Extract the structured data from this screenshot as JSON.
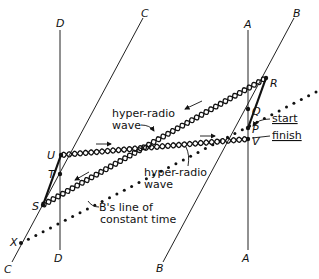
{
  "diagram": {
    "worldlines": [
      {
        "id": "D",
        "top_label": "D",
        "bottom_label": "D"
      },
      {
        "id": "C",
        "top_label": "C",
        "bottom_label": "C"
      },
      {
        "id": "A",
        "top_label": "A",
        "bottom_label": "A"
      },
      {
        "id": "B",
        "top_label": "B",
        "bottom_label": "B"
      }
    ],
    "events": [
      {
        "id": "R",
        "label": "R"
      },
      {
        "id": "Q",
        "label": "Q"
      },
      {
        "id": "P",
        "label": "P"
      },
      {
        "id": "V",
        "label": "V"
      },
      {
        "id": "U",
        "label": "U"
      },
      {
        "id": "T",
        "label": "T"
      },
      {
        "id": "S",
        "label": "S"
      },
      {
        "id": "X",
        "label": "X"
      }
    ],
    "annotations": {
      "wave_upper_line1": "hyper-radio",
      "wave_upper_line2": "wave",
      "wave_lower_line1": "hyper-radio",
      "wave_lower_line2": "wave",
      "start": "start",
      "finish": "finish",
      "constant_time_line1": "B's line of",
      "constant_time_line2": "constant time"
    }
  }
}
